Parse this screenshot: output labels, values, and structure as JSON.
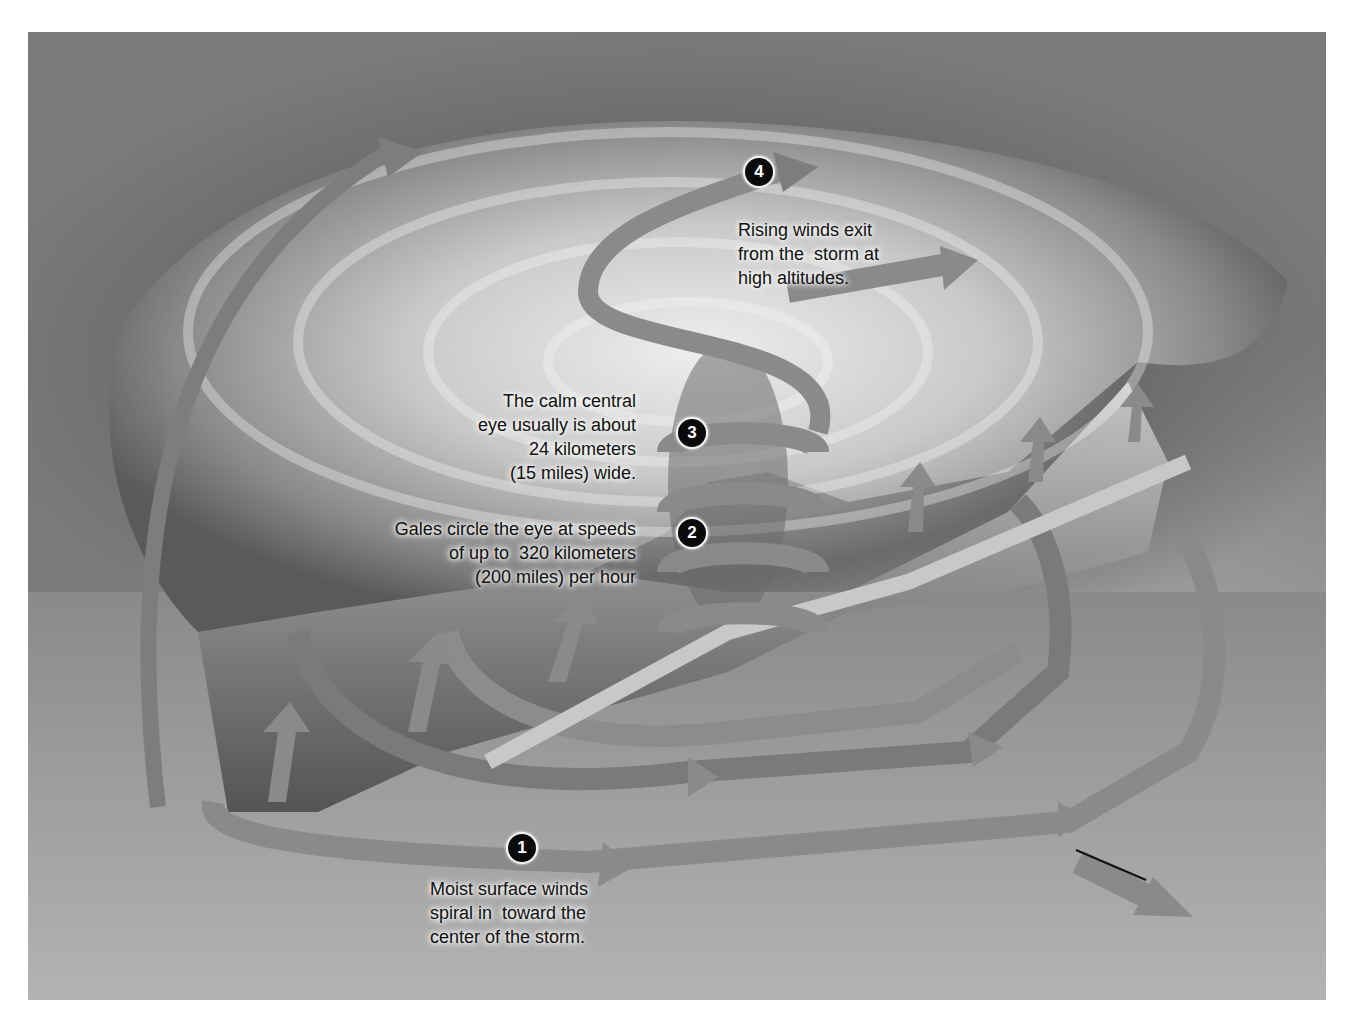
{
  "diagram": {
    "colors": {
      "background": "#ffffff",
      "sky": "#050505",
      "cloud": "#d8d8d8",
      "ribbon": "#7d7d7d",
      "ribbon_light": "#b5b5b5",
      "text": "#111111",
      "badge": "#0a0a0a"
    },
    "callouts": [
      {
        "number": "1",
        "lines": [
          "Moist surface winds",
          "spiral in  toward the",
          "center of the storm."
        ]
      },
      {
        "number": "2",
        "lines": [
          "Gales circle the eye at speeds",
          "of up to  320 kilometers",
          "(200 miles) per hour"
        ]
      },
      {
        "number": "3",
        "lines": [
          "The calm central",
          "eye usually is about",
          "24 kilometers",
          "(15 miles) wide."
        ]
      },
      {
        "number": "4",
        "lines": [
          "Rising winds exit",
          "from the  storm at",
          "high altitudes."
        ]
      }
    ]
  }
}
